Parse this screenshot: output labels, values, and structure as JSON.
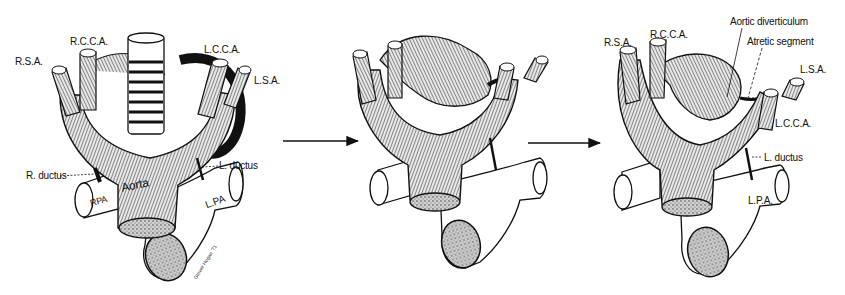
{
  "figure": {
    "arrow_icon": "right-arrow",
    "panels": [
      {
        "id": "panel-1",
        "labels": {
          "rsa": "R.S.A.",
          "rcca": "R.C.C.A.",
          "lcca": "L.C.C.A.",
          "lsa": "L.S.A.",
          "r_ductus": "R. ductus",
          "l_ductus": "L. ductus",
          "aorta": "Aorta",
          "rpa": "RPA",
          "lpa": "L.PA"
        },
        "signature": "Grover Hogan '71"
      },
      {
        "id": "panel-2",
        "labels": {}
      },
      {
        "id": "panel-3",
        "labels": {
          "rsa": "R.S.A.",
          "rcca": "R.C.C.A.",
          "aortic_diverticulum": "Aortic diverticulum",
          "atretic_segment": "Atretic segment",
          "lsa": "L.S.A.",
          "lcca": "L.C.C.A.",
          "l_ductus": "L. ductus",
          "lpa": "L.P.A."
        }
      }
    ]
  },
  "colors": {
    "ink": "#111111",
    "vessel_fill": "#9a9a9a",
    "vessel_light": "#d6d6d6",
    "paper": "#ffffff"
  }
}
